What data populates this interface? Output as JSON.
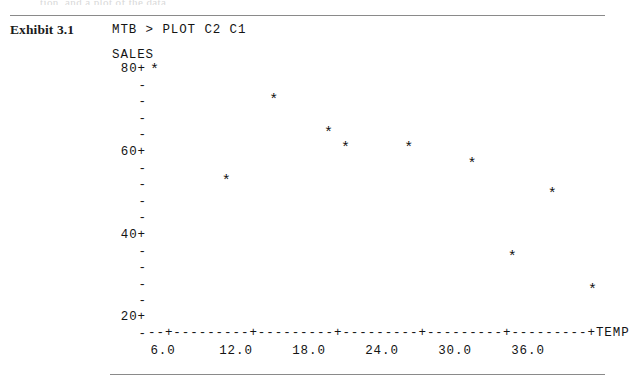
{
  "page": {
    "cut_off_top_text": "tion, and a plot of the data",
    "exhibit_label": "Exhibit 3.1",
    "command_line": "MTB > PLOT C2 C1"
  },
  "plot": {
    "y_axis_title": "SALES",
    "x_axis_title": "TEMP",
    "x_axis_line": "--+---------+---------+---------+---------+---------+TEMP",
    "y_tick_labels": [
      "80+",
      "60+",
      "40+",
      "20+"
    ],
    "y_dash": "-",
    "x_tick_labels": [
      "6.0",
      "12.0",
      "18.0",
      "24.0",
      "30.0",
      "36.0"
    ],
    "point_glyph": "*"
  },
  "chart_data": {
    "type": "scatter",
    "title": "",
    "xlabel": "TEMP",
    "ylabel": "SALES",
    "xlim": [
      4.8,
      42.0
    ],
    "ylim": [
      17.0,
      82.0
    ],
    "grid": false,
    "legend": "none",
    "x_ticks": [
      6.0,
      12.0,
      18.0,
      24.0,
      30.0,
      36.0
    ],
    "y_ticks": [
      20,
      40,
      60,
      80
    ],
    "series": [
      {
        "name": "SALES vs TEMP",
        "marker": "*",
        "points": [
          {
            "x": 5.3,
            "y": 80.0
          },
          {
            "x": 11.2,
            "y": 53.3
          },
          {
            "x": 15.1,
            "y": 72.8
          },
          {
            "x": 19.6,
            "y": 64.9
          },
          {
            "x": 21.0,
            "y": 61.3
          },
          {
            "x": 26.2,
            "y": 61.3
          },
          {
            "x": 31.4,
            "y": 57.4
          },
          {
            "x": 34.7,
            "y": 35.0
          },
          {
            "x": 38.0,
            "y": 50.2
          },
          {
            "x": 41.3,
            "y": 27.0
          }
        ]
      }
    ]
  },
  "geometry": {
    "x_pixel_at_6": 163,
    "x_pixels_per_unit": 12.1667,
    "y_pixel_at_80": 70,
    "y_pixels_per_unit": 4.15,
    "y_row_positions": [
      70,
      86.6,
      103.2,
      119.8,
      136.4,
      153,
      169.6,
      186.2,
      202.8,
      219.4,
      236,
      252.6,
      269.2,
      285.8,
      302.4,
      318,
      334.6
    ],
    "y_label_rows": [
      0,
      5,
      10,
      15
    ],
    "y_label_left": 112,
    "x_tick_pixels": [
      163,
      236,
      309,
      382,
      455,
      528
    ]
  }
}
